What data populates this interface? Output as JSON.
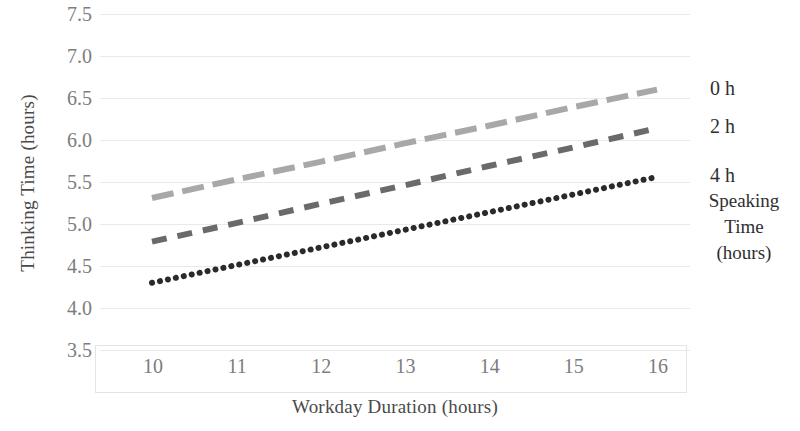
{
  "chart_data": {
    "type": "line",
    "title": "",
    "xlabel": "Workday Duration (hours)",
    "ylabel": "Thinking Time (hours)",
    "xlim": [
      10,
      16
    ],
    "ylim": [
      3.5,
      7.5
    ],
    "xticks": [
      "10",
      "11",
      "12",
      "13",
      "14",
      "15",
      "16"
    ],
    "yticks": [
      "7.5",
      "7.0",
      "6.5",
      "6.0",
      "5.5",
      "5.0",
      "4.5",
      "4.0",
      "3.5"
    ],
    "grid": true,
    "legend_position": "right",
    "legend_title": "Speaking Time (hours)",
    "legend_title_lines": [
      "Speaking",
      "Time",
      "(hours)"
    ],
    "x": [
      10,
      11,
      12,
      13,
      14,
      15,
      16
    ],
    "series": [
      {
        "name": "0 h",
        "color": "#a8a8a8",
        "style": "long-dash",
        "values": [
          5.31,
          5.53,
          5.74,
          5.96,
          6.17,
          6.39,
          6.6
        ]
      },
      {
        "name": "2 h",
        "color": "#6a6a6a",
        "style": "dash",
        "values": [
          4.79,
          5.01,
          5.24,
          5.46,
          5.69,
          5.91,
          6.14
        ]
      },
      {
        "name": "4 h",
        "color": "#2a2a2a",
        "style": "dot",
        "values": [
          4.3,
          4.51,
          4.72,
          4.93,
          5.14,
          5.35,
          5.56
        ]
      }
    ]
  },
  "axes": {
    "y_title": "Thinking Time (hours)",
    "x_title": "Workday Duration (hours)",
    "y_tick_labels": [
      "7.5",
      "7.0",
      "6.5",
      "6.0",
      "5.5",
      "5.0",
      "4.5",
      "4.0",
      "3.5"
    ],
    "x_tick_labels": [
      "10",
      "11",
      "12",
      "13",
      "14",
      "15",
      "16"
    ]
  },
  "legend": {
    "entries": [
      {
        "label": "0 h"
      },
      {
        "label": "2 h"
      },
      {
        "label": "4 h"
      }
    ],
    "title_line1": "Speaking",
    "title_line2": "Time",
    "title_line3": "(hours)"
  },
  "colors": {
    "series_0h": "#a8a8a8",
    "series_2h": "#6a6a6a",
    "series_4h": "#2a2a2a",
    "gridline": "#e9e9e9",
    "tick_text": "#7d7d7d",
    "axis_title_text": "#4a4a4a",
    "background": "#ffffff"
  }
}
